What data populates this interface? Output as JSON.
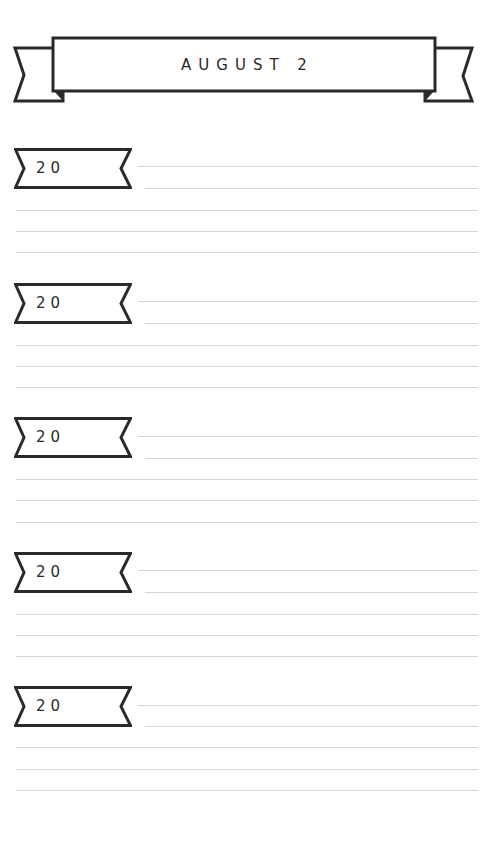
{
  "header": {
    "title": "AUGUST 2"
  },
  "entries": [
    {
      "year_label": "20"
    },
    {
      "year_label": "20"
    },
    {
      "year_label": "20"
    },
    {
      "year_label": "20"
    },
    {
      "year_label": "20"
    }
  ],
  "colors": {
    "ink": "#2a2a2a",
    "rule": "#d6d6d6",
    "paper": "#ffffff"
  }
}
